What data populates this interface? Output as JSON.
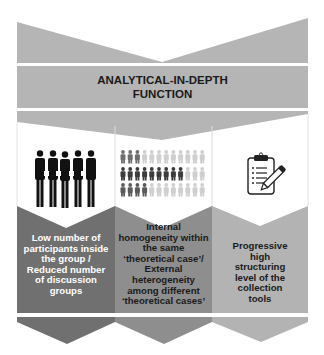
{
  "title": {
    "line1": "ANALYTICAL-IN-DEPTH",
    "line2": "FUNCTION"
  },
  "colors": {
    "band_gray": "#b5b5b5",
    "col1": "#707070",
    "col2": "#8e8e8e",
    "col3": "#b3b3b3",
    "text_dark": "#1a1a1a",
    "text_light": "#ffffff"
  },
  "columns": [
    {
      "icon": "group-of-people-icon",
      "lines": [
        "Low number of",
        "participants inside",
        "the group /",
        "Reduced number",
        "of discussion",
        "groups"
      ]
    },
    {
      "icon": "people-pictogram-grid-icon",
      "pictogram_rows": [
        {
          "dark": 3,
          "light": 9
        },
        {
          "dark": 9,
          "light": 3
        },
        {
          "dark": 4,
          "light": 8
        }
      ],
      "lines": [
        "Internal",
        "homogeneity within",
        "the same",
        "‘theoretical case’/",
        "External",
        "heterogeneity",
        "among different",
        "‘theoretical cases’"
      ]
    },
    {
      "icon": "clipboard-pencil-icon",
      "lines": [
        "Progressive",
        "high",
        "structuring",
        "level of the",
        "collection",
        "tools"
      ]
    }
  ]
}
